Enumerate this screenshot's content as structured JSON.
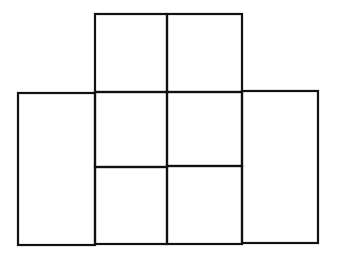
{
  "diagram": {
    "stroke_color": "#111111",
    "background": "#ffffff",
    "stroke_width": 2.2,
    "rectangles": [
      {
        "id": "top-left-cell",
        "x": 95,
        "y": 14,
        "w": 72,
        "h": 78
      },
      {
        "id": "top-right-cell",
        "x": 167,
        "y": 14,
        "w": 75,
        "h": 78
      },
      {
        "id": "left-tall-cell",
        "x": 18,
        "y": 93,
        "w": 77,
        "h": 152
      },
      {
        "id": "mid-left-upper",
        "x": 95,
        "y": 92,
        "w": 72,
        "h": 75
      },
      {
        "id": "mid-right-upper",
        "x": 167,
        "y": 92,
        "w": 75,
        "h": 74
      },
      {
        "id": "mid-left-lower",
        "x": 95,
        "y": 167,
        "w": 72,
        "h": 77
      },
      {
        "id": "mid-right-lower",
        "x": 167,
        "y": 166,
        "w": 75,
        "h": 78
      },
      {
        "id": "right-tall-cell",
        "x": 242,
        "y": 91,
        "w": 76,
        "h": 152
      }
    ]
  }
}
